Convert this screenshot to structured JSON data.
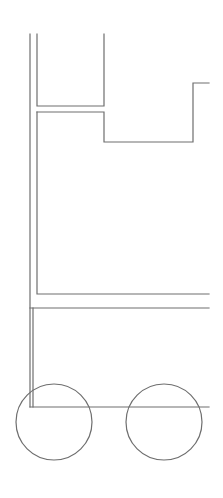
{
  "diagram": {
    "width": 223,
    "height": 498,
    "background": "#ffffff",
    "stroke_color": "#6e6e6e",
    "parts": {
      "mast_outer_line": {
        "x1": 30,
        "y1": 34,
        "x2": 30,
        "y2": 407
      },
      "upper_compartment": {
        "points": "37,34 37,106 104,106 104,34"
      },
      "body_outline": {
        "points": "37,112 37,294 209,294"
      },
      "body_upper_step": {
        "points": "37,112 104,112 104,142 193,142 193,83 209,83"
      },
      "chassis_top_line": {
        "x1": 30,
        "y1": 308,
        "x2": 209,
        "y2": 308
      },
      "chassis_inner_post": {
        "x1": 33,
        "y1": 308,
        "x2": 33,
        "y2": 407
      },
      "chassis_bottom_line": {
        "x1": 30,
        "y1": 407,
        "x2": 209,
        "y2": 407
      },
      "wheels": [
        {
          "name": "front-wheel",
          "cx": 54,
          "cy": 422,
          "r": 38
        },
        {
          "name": "rear-wheel",
          "cx": 164,
          "cy": 422,
          "r": 38
        }
      ]
    }
  }
}
